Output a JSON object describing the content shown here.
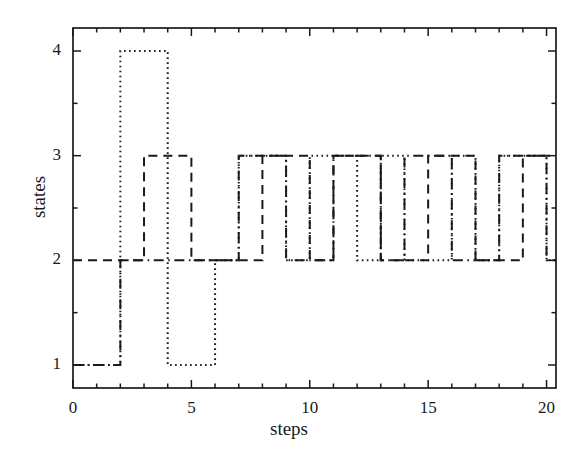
{
  "chart_data": {
    "type": "line",
    "title": "",
    "xlabel": "steps",
    "ylabel": "states",
    "xlim": [
      0,
      20.4
    ],
    "ylim": [
      0.78,
      4.22
    ],
    "grid": false,
    "legend": "none",
    "drawstyle": "steps-post",
    "xticks_major": [
      0,
      5,
      10,
      15,
      20
    ],
    "xticks_major_labels": [
      "0",
      "5",
      "10",
      "15",
      "20"
    ],
    "xticks_minor": [
      1,
      2,
      3,
      4,
      6,
      7,
      8,
      9,
      11,
      12,
      13,
      14,
      16,
      17,
      18,
      19
    ],
    "yticks_major": [
      1,
      2,
      3,
      4
    ],
    "yticks_major_labels": [
      "1",
      "2",
      "3",
      "4"
    ],
    "yticks_minor": [
      1.5,
      2.5,
      3.5
    ],
    "series": [
      {
        "name": "series-dotted",
        "linestyle": "dotted",
        "color": "#1a1a1a",
        "x": [
          0,
          1,
          2,
          3,
          4,
          5,
          6,
          7,
          8,
          9,
          10,
          11,
          12,
          13,
          14,
          15,
          16,
          17,
          18,
          19,
          20
        ],
        "values": [
          1,
          1,
          4,
          4,
          1,
          1,
          2,
          3,
          3,
          2,
          3,
          3,
          2,
          3,
          2,
          2,
          3,
          2,
          3,
          3,
          2
        ]
      },
      {
        "name": "series-dashed",
        "linestyle": "dashed",
        "color": "#1a1a1a",
        "x": [
          0,
          1,
          2,
          3,
          4,
          5,
          6,
          7,
          8,
          9,
          10,
          11,
          12,
          13,
          14,
          15,
          16,
          17,
          18,
          19,
          20
        ],
        "values": [
          2,
          2,
          2,
          3,
          3,
          2,
          2,
          2,
          3,
          3,
          2,
          3,
          3,
          2,
          2,
          3,
          3,
          2,
          2,
          3,
          3
        ]
      },
      {
        "name": "series-dashdot",
        "linestyle": "dashdot",
        "color": "#1a1a1a",
        "x": [
          0,
          1,
          2,
          3,
          4,
          5,
          6,
          7,
          8,
          9,
          10,
          11,
          12,
          13,
          14,
          15,
          16,
          17,
          18,
          19,
          20
        ],
        "values": [
          1,
          1,
          2,
          2,
          2,
          2,
          2,
          3,
          3,
          2,
          2,
          3,
          3,
          2,
          3,
          3,
          2,
          2,
          3,
          3,
          2
        ]
      }
    ]
  },
  "axes": {
    "xlabel": "steps",
    "ylabel": "states",
    "frame_color": "#1a1a1a"
  }
}
